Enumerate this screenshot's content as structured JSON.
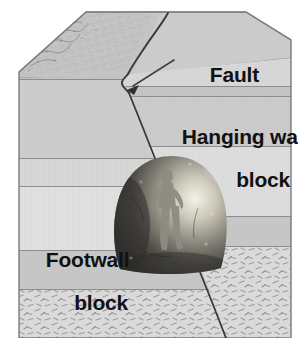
{
  "figure": {
    "type": "geologic-block-diagram",
    "width": 298,
    "height": 338,
    "background_color": "#ffffff"
  },
  "labels": {
    "fault": "Fault",
    "hanging_wall_line1": "Hanging wall",
    "hanging_wall_line2": "block",
    "footwall_line1": "Footwall",
    "footwall_line2": "block"
  },
  "colors": {
    "text": "#111111",
    "outline": "#6a6a6a",
    "fault_line": "#3a3a3a",
    "leader_line": "#3f3f3f",
    "top_surface": "#cccccc",
    "top_surface_left": "#c4c4c4",
    "stratum_light": "#d9d9d9",
    "stratum_mid": "#cbcbcb",
    "stratum_dark": "#bfbfbf",
    "stratum_pale": "#e2e2e2",
    "textured_layer": "#d2d2d2",
    "texture_mark": "#9a9a9a",
    "rock_dark": "#3b3a38",
    "rock_mid": "#7c7a74",
    "rock_highlight": "#f2f0e6",
    "figure_silhouette": "#8d8a82"
  },
  "geometry": {
    "block_left_x": 19,
    "block_right_x": 291,
    "block_bottom_y": 338,
    "top_apex_y": 12,
    "fault_top_x": 168,
    "fault_bottom_x": 226
  },
  "strata": {
    "footwall_boundaries_y": [
      70,
      79,
      158,
      186,
      250,
      289
    ],
    "hangingwall_boundaries_y": [
      86,
      96,
      146,
      216,
      246
    ]
  },
  "annotations": {
    "leader_from": {
      "x": 172,
      "y": 62
    },
    "leader_to": {
      "x": 129,
      "y": 89
    },
    "arrowhead": "arrow-down-left"
  },
  "inset_photo": {
    "description": "photograph of a person standing beside a rounded boulder / rock outcrop",
    "center_x": 170,
    "center_y": 213,
    "radius_x": 55,
    "radius_y": 56
  }
}
